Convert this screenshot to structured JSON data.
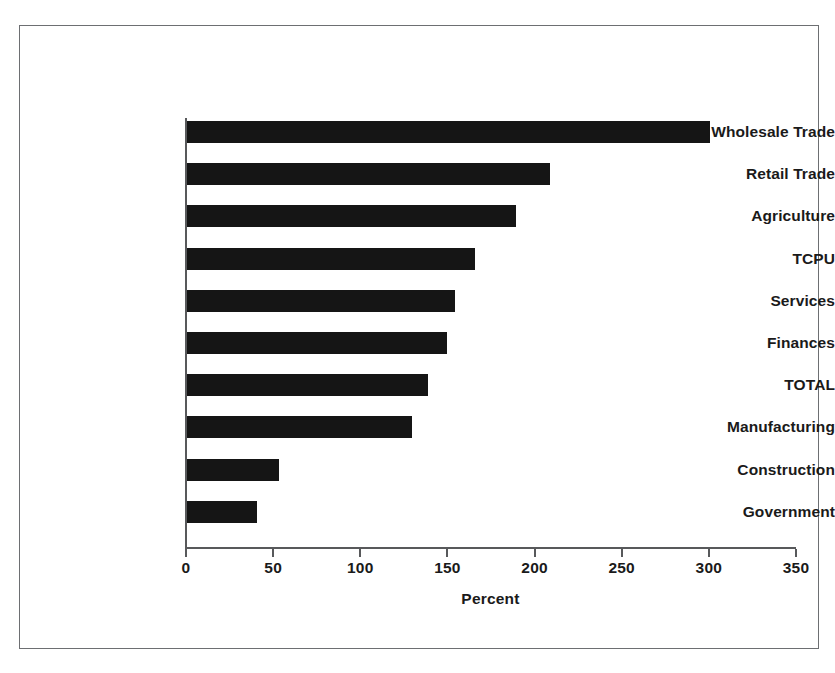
{
  "chart_data": {
    "type": "bar",
    "orientation": "horizontal",
    "title": "",
    "xlabel": "Percent",
    "ylabel": "",
    "xlim": [
      0,
      350
    ],
    "xticks": [
      0,
      50,
      100,
      150,
      200,
      250,
      300,
      350
    ],
    "xtick_labels": [
      "0",
      "50",
      "100",
      "150",
      "200",
      "250",
      "300",
      "350"
    ],
    "grid": false,
    "legend": false,
    "bar_color": "#151515",
    "categories": [
      "Wholesale Trade",
      "Retail Trade",
      "Agriculture",
      "TCPU",
      "Services",
      "Finances",
      "TOTAL",
      "Manufacturing",
      "Construction",
      "Government"
    ],
    "values": [
      300,
      208,
      189,
      165,
      154,
      149,
      138,
      129,
      53,
      40
    ]
  },
  "figure": {
    "frame_color": "#6d6f72",
    "axis_color": "#58595b",
    "background": "#ffffff"
  }
}
